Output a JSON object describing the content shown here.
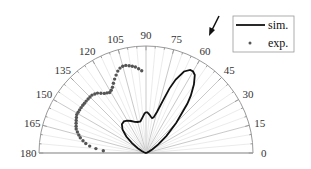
{
  "chart_data": {
    "type": "polar-line-scatter",
    "title": "",
    "angular_axis": {
      "range_deg": [
        0,
        180
      ],
      "tick_labels": [
        "0",
        "15",
        "30",
        "45",
        "60",
        "75",
        "90",
        "105",
        "120",
        "135",
        "150",
        "165",
        "180"
      ],
      "minor_gridlines_deg_step": 5
    },
    "radial_axis": {
      "range": [
        0,
        1
      ],
      "tick_labels": []
    },
    "annotation": {
      "type": "arrow",
      "points_to_deg": 60,
      "label": ""
    },
    "legend": {
      "position": "upper-right",
      "entries": [
        {
          "label": "sim.",
          "style": "solid-line"
        },
        {
          "label": "exp.",
          "style": "dot-marker"
        }
      ]
    },
    "series": [
      {
        "name": "sim.",
        "type": "line",
        "color": "#111111",
        "theta_deg": [
          0,
          5,
          10,
          15,
          20,
          25,
          30,
          35,
          40,
          45,
          50,
          52,
          55,
          58,
          60,
          62,
          65,
          68,
          70,
          72,
          75,
          78,
          80,
          82,
          85,
          88,
          90,
          92,
          95,
          100,
          105,
          110,
          115,
          120,
          125,
          130,
          135,
          140,
          145,
          150,
          155,
          160,
          165,
          170,
          175,
          180
        ],
        "r": [
          0,
          0,
          0,
          0,
          0.01,
          0.03,
          0.07,
          0.14,
          0.25,
          0.4,
          0.6,
          0.68,
          0.78,
          0.86,
          0.88,
          0.88,
          0.84,
          0.74,
          0.64,
          0.52,
          0.4,
          0.34,
          0.33,
          0.34,
          0.36,
          0.38,
          0.38,
          0.37,
          0.34,
          0.3,
          0.3,
          0.31,
          0.33,
          0.35,
          0.36,
          0.35,
          0.31,
          0.24,
          0.16,
          0.09,
          0.04,
          0.02,
          0.01,
          0,
          0,
          0
        ]
      },
      {
        "name": "exp.",
        "type": "scatter",
        "color": "#555555",
        "theta_deg": [
          93,
          95,
          97,
          99,
          101,
          103,
          105,
          107,
          109,
          111,
          113,
          115,
          117,
          119,
          121,
          123,
          125,
          127,
          129,
          131,
          133,
          135,
          137,
          139,
          141,
          143,
          145,
          147,
          149,
          151,
          153,
          155,
          157,
          159,
          161,
          163,
          165,
          167,
          169,
          171,
          173,
          175,
          177
        ],
        "r": [
          0.77,
          0.79,
          0.81,
          0.82,
          0.83,
          0.84,
          0.84,
          0.83,
          0.81,
          0.78,
          0.75,
          0.72,
          0.69,
          0.67,
          0.66,
          0.67,
          0.68,
          0.7,
          0.72,
          0.73,
          0.74,
          0.74,
          0.74,
          0.74,
          0.74,
          0.74,
          0.74,
          0.74,
          0.74,
          0.74,
          0.73,
          0.72,
          0.71,
          0.7,
          0.69,
          0.67,
          0.65,
          0.63,
          0.6,
          0.57,
          0.53,
          0.47,
          0.4
        ]
      }
    ]
  }
}
